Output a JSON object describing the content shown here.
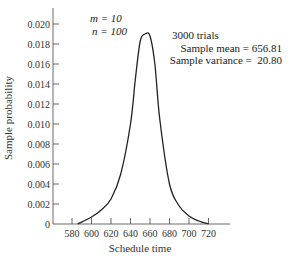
{
  "chart_data": {
    "type": "line",
    "title": "",
    "xlabel": "Schedule time",
    "ylabel": "Sample probability",
    "xlim": [
      570,
      740
    ],
    "ylim": [
      0,
      0.021
    ],
    "grid": false,
    "x_ticks": [
      580,
      600,
      620,
      640,
      660,
      680,
      700,
      720
    ],
    "y_ticks": [
      {
        "value": 0,
        "label": "0"
      },
      {
        "value": 0.002,
        "label": "0.002"
      },
      {
        "value": 0.004,
        "label": "0.004"
      },
      {
        "value": 0.006,
        "label": "0.006"
      },
      {
        "value": 0.008,
        "label": "0.008"
      },
      {
        "value": 0.01,
        "label": "0.010"
      },
      {
        "value": 0.012,
        "label": "0.012"
      },
      {
        "value": 0.014,
        "label": "0.014"
      },
      {
        "value": 0.016,
        "label": "0.016"
      },
      {
        "value": 0.018,
        "label": "0.018"
      },
      {
        "value": 0.02,
        "label": "0.020"
      }
    ],
    "series": [
      {
        "name": "Sample probability distribution",
        "x": [
          586,
          600,
          610,
          620,
          630,
          640,
          645,
          650,
          655,
          660,
          665,
          670,
          680,
          690,
          700,
          710,
          720
        ],
        "values": [
          0,
          0.0007,
          0.0014,
          0.0025,
          0.005,
          0.01,
          0.0145,
          0.0183,
          0.019,
          0.0188,
          0.016,
          0.0105,
          0.004,
          0.0018,
          0.0008,
          0.0003,
          0
        ]
      }
    ],
    "annotations": {
      "m": "m = 10",
      "n": "n = 100",
      "trials": "3000 trials",
      "mean": "Sample mean = 656.81",
      "variance": "Sample variance =  20.80"
    }
  }
}
